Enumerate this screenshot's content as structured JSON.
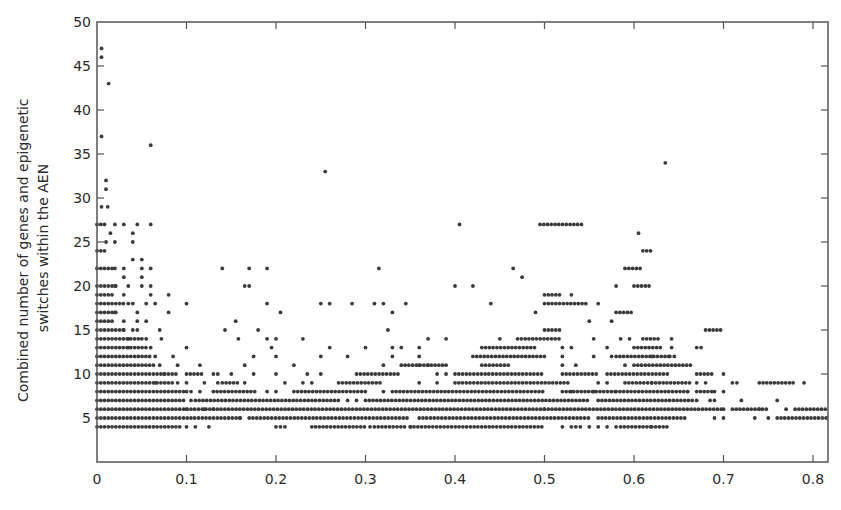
{
  "chart_data": {
    "type": "scatter",
    "title": "",
    "xlabel": "",
    "ylabel": "Combined number of genes and epigenetic switches within the AEN",
    "ylabel_lines": [
      "Combined number of genes and epigenetic",
      "switches within the AEN"
    ],
    "xlim": [
      0,
      0.81
    ],
    "ylim": [
      0,
      50
    ],
    "x_ticks": [
      0,
      0.1,
      0.2,
      0.3,
      0.4,
      0.5,
      0.6,
      0.7,
      0.8
    ],
    "x_tick_labels": [
      "0",
      "0.1",
      "0.2",
      "0.3",
      "0.4",
      "0.5",
      "0.6",
      "0.7",
      "0.8"
    ],
    "y_ticks": [
      5,
      10,
      15,
      20,
      25,
      30,
      35,
      40,
      45,
      50
    ],
    "y_tick_labels": [
      "5",
      "10",
      "15",
      "20",
      "25",
      "30",
      "35",
      "40",
      "45",
      "50"
    ],
    "grid": false,
    "legend": null,
    "marker_color": "#3a3a3a",
    "runs_note": "Dense horizontal bands of points at integer y; each run [y, x_start, x_end] is densely filled with points",
    "runs": [
      [
        4,
        0.0,
        0.095
      ],
      [
        4,
        0.24,
        0.3
      ],
      [
        4,
        0.31,
        0.345
      ],
      [
        4,
        0.35,
        0.5
      ],
      [
        4,
        0.585,
        0.62
      ],
      [
        4,
        0.62,
        0.64
      ],
      [
        5,
        0.0,
        0.16
      ],
      [
        5,
        0.17,
        0.35
      ],
      [
        5,
        0.36,
        0.55
      ],
      [
        5,
        0.56,
        0.66
      ],
      [
        5,
        0.76,
        0.815
      ],
      [
        6,
        0.0,
        0.5
      ],
      [
        6,
        0.5,
        0.7
      ],
      [
        6,
        0.71,
        0.75
      ],
      [
        6,
        0.78,
        0.815
      ],
      [
        7,
        0.0,
        0.1
      ],
      [
        7,
        0.11,
        0.27
      ],
      [
        7,
        0.3,
        0.55
      ],
      [
        7,
        0.56,
        0.665
      ],
      [
        8,
        0.0,
        0.1
      ],
      [
        8,
        0.13,
        0.18
      ],
      [
        8,
        0.22,
        0.3
      ],
      [
        8,
        0.33,
        0.5
      ],
      [
        8,
        0.52,
        0.58
      ],
      [
        8,
        0.58,
        0.66
      ],
      [
        8,
        0.67,
        0.69
      ],
      [
        9,
        0.0,
        0.085
      ],
      [
        9,
        0.14,
        0.16
      ],
      [
        9,
        0.27,
        0.32
      ],
      [
        9,
        0.4,
        0.53
      ],
      [
        9,
        0.59,
        0.62
      ],
      [
        9,
        0.62,
        0.665
      ],
      [
        9,
        0.74,
        0.78
      ],
      [
        10,
        0.0,
        0.09
      ],
      [
        10,
        0.1,
        0.12
      ],
      [
        10,
        0.29,
        0.34
      ],
      [
        10,
        0.4,
        0.5
      ],
      [
        10,
        0.52,
        0.56
      ],
      [
        10,
        0.57,
        0.64
      ],
      [
        10,
        0.67,
        0.69
      ],
      [
        11,
        0.0,
        0.065
      ],
      [
        11,
        0.34,
        0.39
      ],
      [
        11,
        0.43,
        0.46
      ],
      [
        11,
        0.6,
        0.665
      ],
      [
        12,
        0.0,
        0.06
      ],
      [
        12,
        0.42,
        0.5
      ],
      [
        12,
        0.58,
        0.64
      ],
      [
        13,
        0.0,
        0.055
      ],
      [
        13,
        0.43,
        0.49
      ],
      [
        13,
        0.6,
        0.63
      ],
      [
        14,
        0.0,
        0.05
      ],
      [
        14,
        0.47,
        0.52
      ],
      [
        14,
        0.61,
        0.63
      ],
      [
        15,
        0.0,
        0.03
      ],
      [
        15,
        0.5,
        0.52
      ],
      [
        15,
        0.68,
        0.7
      ],
      [
        16,
        0.0,
        0.02
      ],
      [
        17,
        0.0,
        0.025
      ],
      [
        17,
        0.58,
        0.6
      ],
      [
        18,
        0.0,
        0.03
      ],
      [
        18,
        0.5,
        0.55
      ],
      [
        19,
        0.0,
        0.02
      ],
      [
        19,
        0.5,
        0.52
      ],
      [
        20,
        0.0,
        0.025
      ],
      [
        20,
        0.6,
        0.62
      ],
      [
        22,
        0.0,
        0.02
      ],
      [
        22,
        0.59,
        0.61
      ],
      [
        24,
        0.0,
        0.01
      ],
      [
        24,
        0.61,
        0.62
      ],
      [
        27,
        0.0,
        0.012
      ],
      [
        27,
        0.495,
        0.545
      ]
    ],
    "points": [
      [
        0.005,
        47
      ],
      [
        0.005,
        46
      ],
      [
        0.013,
        43
      ],
      [
        0.005,
        37
      ],
      [
        0.06,
        36
      ],
      [
        0.255,
        33
      ],
      [
        0.635,
        34
      ],
      [
        0.01,
        32
      ],
      [
        0.01,
        31
      ],
      [
        0.005,
        29
      ],
      [
        0.012,
        29
      ],
      [
        0.02,
        27
      ],
      [
        0.03,
        27
      ],
      [
        0.045,
        27
      ],
      [
        0.06,
        27
      ],
      [
        0.405,
        27
      ],
      [
        0.015,
        26
      ],
      [
        0.04,
        26
      ],
      [
        0.605,
        26
      ],
      [
        0.01,
        25
      ],
      [
        0.02,
        25
      ],
      [
        0.04,
        25
      ],
      [
        0.04,
        23
      ],
      [
        0.05,
        23
      ],
      [
        0.02,
        22
      ],
      [
        0.03,
        22
      ],
      [
        0.05,
        22
      ],
      [
        0.06,
        22
      ],
      [
        0.14,
        22
      ],
      [
        0.17,
        22
      ],
      [
        0.19,
        22
      ],
      [
        0.315,
        22
      ],
      [
        0.465,
        22
      ],
      [
        0.03,
        21
      ],
      [
        0.05,
        21
      ],
      [
        0.475,
        21
      ],
      [
        0.02,
        20
      ],
      [
        0.035,
        20
      ],
      [
        0.05,
        20
      ],
      [
        0.06,
        20
      ],
      [
        0.17,
        20
      ],
      [
        0.165,
        20
      ],
      [
        0.4,
        20
      ],
      [
        0.42,
        20
      ],
      [
        0.58,
        20
      ],
      [
        0.03,
        19
      ],
      [
        0.06,
        19
      ],
      [
        0.08,
        19
      ],
      [
        0.53,
        19
      ],
      [
        0.035,
        18
      ],
      [
        0.04,
        18
      ],
      [
        0.055,
        18
      ],
      [
        0.065,
        18
      ],
      [
        0.1,
        18
      ],
      [
        0.19,
        18
      ],
      [
        0.25,
        18
      ],
      [
        0.26,
        18
      ],
      [
        0.285,
        18
      ],
      [
        0.31,
        18
      ],
      [
        0.32,
        18
      ],
      [
        0.345,
        18
      ],
      [
        0.44,
        18
      ],
      [
        0.56,
        18
      ],
      [
        0.02,
        17
      ],
      [
        0.045,
        17
      ],
      [
        0.08,
        17
      ],
      [
        0.205,
        17
      ],
      [
        0.33,
        17
      ],
      [
        0.49,
        17
      ],
      [
        0.03,
        16
      ],
      [
        0.045,
        16
      ],
      [
        0.055,
        16
      ],
      [
        0.155,
        16
      ],
      [
        0.55,
        16
      ],
      [
        0.575,
        16
      ],
      [
        0.03,
        15
      ],
      [
        0.04,
        15
      ],
      [
        0.045,
        15
      ],
      [
        0.07,
        15
      ],
      [
        0.143,
        15
      ],
      [
        0.18,
        15
      ],
      [
        0.325,
        15
      ],
      [
        0.035,
        14
      ],
      [
        0.05,
        14
      ],
      [
        0.055,
        14
      ],
      [
        0.072,
        14
      ],
      [
        0.158,
        14
      ],
      [
        0.19,
        14
      ],
      [
        0.2,
        14
      ],
      [
        0.23,
        14
      ],
      [
        0.37,
        14
      ],
      [
        0.39,
        14
      ],
      [
        0.45,
        14
      ],
      [
        0.555,
        14
      ],
      [
        0.585,
        14
      ],
      [
        0.595,
        14
      ],
      [
        0.642,
        14
      ],
      [
        0.035,
        13
      ],
      [
        0.06,
        13
      ],
      [
        0.1,
        13
      ],
      [
        0.195,
        13
      ],
      [
        0.26,
        13
      ],
      [
        0.3,
        13
      ],
      [
        0.33,
        13
      ],
      [
        0.34,
        13
      ],
      [
        0.36,
        13
      ],
      [
        0.52,
        13
      ],
      [
        0.53,
        13
      ],
      [
        0.57,
        13
      ],
      [
        0.642,
        13
      ],
      [
        0.67,
        13
      ],
      [
        0.675,
        13
      ],
      [
        0.065,
        12
      ],
      [
        0.085,
        12
      ],
      [
        0.175,
        12
      ],
      [
        0.2,
        12
      ],
      [
        0.25,
        12
      ],
      [
        0.28,
        12
      ],
      [
        0.33,
        12
      ],
      [
        0.36,
        12
      ],
      [
        0.52,
        12
      ],
      [
        0.555,
        12
      ],
      [
        0.575,
        12
      ],
      [
        0.62,
        12
      ],
      [
        0.64,
        12
      ],
      [
        0.645,
        12
      ],
      [
        0.07,
        11
      ],
      [
        0.09,
        11
      ],
      [
        0.115,
        11
      ],
      [
        0.165,
        11
      ],
      [
        0.22,
        11
      ],
      [
        0.32,
        11
      ],
      [
        0.36,
        11
      ],
      [
        0.37,
        11
      ],
      [
        0.39,
        11
      ],
      [
        0.52,
        11
      ],
      [
        0.535,
        11
      ],
      [
        0.59,
        11
      ],
      [
        0.075,
        10
      ],
      [
        0.13,
        10
      ],
      [
        0.135,
        10
      ],
      [
        0.15,
        10
      ],
      [
        0.175,
        10
      ],
      [
        0.2,
        10
      ],
      [
        0.235,
        10
      ],
      [
        0.25,
        10
      ],
      [
        0.38,
        10
      ],
      [
        0.39,
        10
      ],
      [
        0.7,
        10
      ],
      [
        0.065,
        9
      ],
      [
        0.09,
        9
      ],
      [
        0.1,
        9
      ],
      [
        0.12,
        9
      ],
      [
        0.135,
        9
      ],
      [
        0.165,
        9
      ],
      [
        0.21,
        9
      ],
      [
        0.23,
        9
      ],
      [
        0.24,
        9
      ],
      [
        0.36,
        9
      ],
      [
        0.38,
        9
      ],
      [
        0.56,
        9
      ],
      [
        0.57,
        9
      ],
      [
        0.67,
        9
      ],
      [
        0.68,
        9
      ],
      [
        0.71,
        9
      ],
      [
        0.715,
        9
      ],
      [
        0.79,
        9
      ],
      [
        0.1,
        8
      ],
      [
        0.105,
        8
      ],
      [
        0.115,
        8
      ],
      [
        0.19,
        8
      ],
      [
        0.2,
        8
      ],
      [
        0.32,
        8
      ],
      [
        0.53,
        8
      ],
      [
        0.555,
        8
      ],
      [
        0.66,
        8
      ],
      [
        0.69,
        8
      ],
      [
        0.7,
        8
      ],
      [
        0.105,
        7
      ],
      [
        0.28,
        7
      ],
      [
        0.29,
        7
      ],
      [
        0.67,
        7
      ],
      [
        0.685,
        7
      ],
      [
        0.69,
        7
      ],
      [
        0.72,
        7
      ],
      [
        0.76,
        7
      ],
      [
        0.1,
        6
      ],
      [
        0.12,
        6
      ],
      [
        0.13,
        6
      ],
      [
        0.7,
        6
      ],
      [
        0.74,
        6
      ],
      [
        0.77,
        6
      ],
      [
        0.16,
        5
      ],
      [
        0.69,
        5
      ],
      [
        0.7,
        5
      ],
      [
        0.735,
        5
      ],
      [
        0.75,
        5
      ],
      [
        0.1,
        4
      ],
      [
        0.11,
        4
      ],
      [
        0.125,
        4
      ],
      [
        0.2,
        4
      ],
      [
        0.205,
        4
      ],
      [
        0.21,
        4
      ],
      [
        0.305,
        4
      ],
      [
        0.35,
        4
      ],
      [
        0.52,
        4
      ],
      [
        0.53,
        4
      ],
      [
        0.535,
        4
      ],
      [
        0.54,
        4
      ],
      [
        0.55,
        4
      ],
      [
        0.56,
        4
      ],
      [
        0.57,
        4
      ],
      [
        0.58,
        4
      ]
    ]
  }
}
